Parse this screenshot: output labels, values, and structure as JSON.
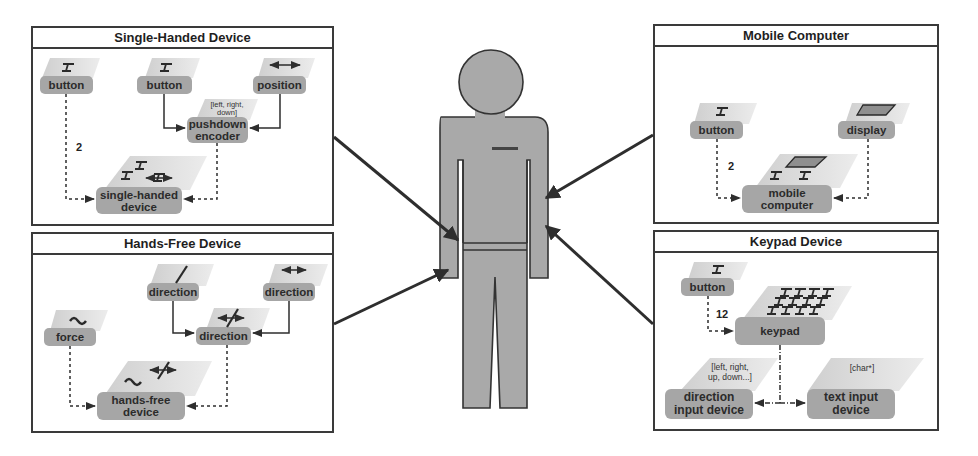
{
  "figure": {
    "center": {
      "name": "user",
      "description": "standing human figure"
    },
    "colors": {
      "block_top": "#d9d9d9",
      "block_label": "#a6a6a6",
      "figure": "#a9a9a9",
      "stroke": "#333333"
    }
  },
  "panels": [
    {
      "id": "single-handed",
      "title": "Single-Handed Device",
      "nodes": [
        {
          "id": "btn1",
          "label": "button",
          "icon": "button-icon"
        },
        {
          "id": "btn2",
          "label": "button",
          "icon": "button-icon"
        },
        {
          "id": "pos",
          "label": "position",
          "icon": "horizontal-arrow-icon"
        },
        {
          "id": "enc",
          "label": "pushdown\nencoder",
          "note": "[left, right,\ndown]"
        },
        {
          "id": "dev",
          "label": "single-handed\ndevice"
        }
      ],
      "edges": [
        {
          "from": "btn1",
          "to": "dev",
          "style": "dashed",
          "count": "2"
        },
        {
          "from": "btn2",
          "to": "enc",
          "style": "solid"
        },
        {
          "from": "pos",
          "to": "enc",
          "style": "solid"
        },
        {
          "from": "enc",
          "to": "dev",
          "style": "dashed"
        }
      ]
    },
    {
      "id": "hands-free",
      "title": "Hands-Free Device",
      "nodes": [
        {
          "id": "dir1",
          "label": "direction",
          "icon": "diagonal-arrow-icon"
        },
        {
          "id": "dir2",
          "label": "direction",
          "icon": "horizontal-arrow-icon"
        },
        {
          "id": "dir3",
          "label": "direction",
          "icon": "cross-arrow-icon"
        },
        {
          "id": "force",
          "label": "force",
          "icon": "force-icon"
        },
        {
          "id": "dev",
          "label": "hands-free\ndevice"
        }
      ],
      "edges": [
        {
          "from": "dir1",
          "to": "dir3",
          "style": "solid"
        },
        {
          "from": "dir2",
          "to": "dir3",
          "style": "solid"
        },
        {
          "from": "force",
          "to": "dev",
          "style": "dashed"
        },
        {
          "from": "dir3",
          "to": "dev",
          "style": "dashed"
        }
      ]
    },
    {
      "id": "mobile",
      "title": "Mobile Computer",
      "nodes": [
        {
          "id": "btn",
          "label": "button",
          "icon": "button-icon"
        },
        {
          "id": "disp",
          "label": "display",
          "icon": "display-icon"
        },
        {
          "id": "dev",
          "label": "mobile\ncomputer"
        }
      ],
      "edges": [
        {
          "from": "btn",
          "to": "dev",
          "style": "dashed",
          "count": "2"
        },
        {
          "from": "disp",
          "to": "dev",
          "style": "dashed"
        }
      ]
    },
    {
      "id": "keypad",
      "title": "Keypad Device",
      "nodes": [
        {
          "id": "btn",
          "label": "button",
          "icon": "button-icon"
        },
        {
          "id": "kp",
          "label": "keypad",
          "icon": "keypad-icon"
        },
        {
          "id": "dir",
          "label": "direction\ninput device",
          "note": "[left, right,\nup, down...]"
        },
        {
          "id": "txt",
          "label": "text input\ndevice",
          "note": "[char*]"
        }
      ],
      "edges": [
        {
          "from": "btn",
          "to": "kp",
          "style": "dashed",
          "count": "12"
        },
        {
          "from": "kp",
          "to": "dir",
          "style": "dash-dot"
        },
        {
          "from": "kp",
          "to": "txt",
          "style": "dash-dot"
        }
      ]
    }
  ]
}
